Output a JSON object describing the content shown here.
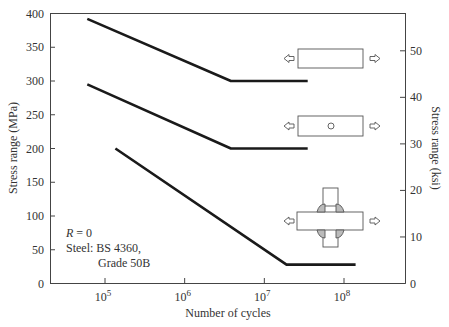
{
  "chart_data": {
    "type": "line",
    "title": "",
    "xlabel": "Number of cycles",
    "ylabel": "Stress range (MPa)",
    "ylabel_right": "Stress range (ksi)",
    "xscale": "log",
    "xlim": [
      40000,
      300000000
    ],
    "ylim": [
      0,
      400
    ],
    "ylim_right": [
      0,
      58
    ],
    "grid": false,
    "x_ticks": [
      {
        "value": 100000,
        "label_base": "10",
        "label_exp": "5"
      },
      {
        "value": 1000000,
        "label_base": "10",
        "label_exp": "6"
      },
      {
        "value": 10000000,
        "label_base": "10",
        "label_exp": "7"
      },
      {
        "value": 100000000,
        "label_base": "10",
        "label_exp": "8"
      }
    ],
    "y_ticks": [
      "0",
      "50",
      "100",
      "150",
      "200",
      "250",
      "300",
      "350",
      "400"
    ],
    "y_ticks_right": [
      "0",
      "10",
      "20",
      "30",
      "40",
      "50"
    ],
    "series": [
      {
        "name": "Plain plate (unnotched)",
        "specimen_icon": "plain-plate-icon",
        "x": [
          60000,
          3800000,
          35000000
        ],
        "y": [
          392,
          300,
          300
        ]
      },
      {
        "name": "Plate with hole",
        "specimen_icon": "plate-with-hole-icon",
        "x": [
          60000,
          3800000,
          35000000
        ],
        "y": [
          295,
          200,
          200
        ]
      },
      {
        "name": "Cruciform welded joint",
        "specimen_icon": "cruciform-weld-icon",
        "x": [
          135000,
          19000000,
          140000000
        ],
        "y": [
          200,
          28,
          28
        ]
      }
    ],
    "annotations": {
      "line1": "R = 0",
      "line1_italic_part": "R",
      "line1_rest": " = 0",
      "line2": "Steel: BS 4360,",
      "line3": "Grade 50B"
    },
    "legend": "none (specimen sketches placed beside each curve)"
  }
}
